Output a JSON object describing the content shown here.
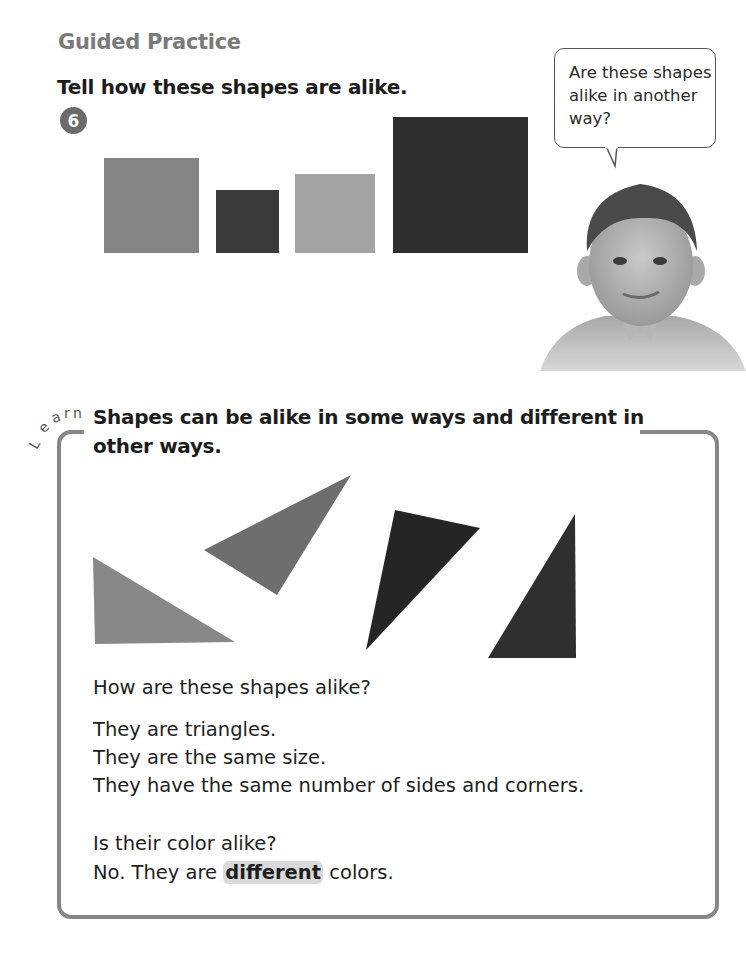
{
  "header": {
    "section_title": "Guided Practice",
    "instruction": "Tell how these shapes are alike."
  },
  "problem": {
    "number": "6",
    "squares": [
      {
        "x": 104,
        "y": 158,
        "w": 95,
        "h": 95,
        "color": "#848484"
      },
      {
        "x": 216,
        "y": 190,
        "w": 63,
        "h": 63,
        "color": "#3a3a3a"
      },
      {
        "x": 295,
        "y": 174,
        "w": 80,
        "h": 79,
        "color": "#a3a3a3"
      },
      {
        "x": 393,
        "y": 117,
        "w": 135,
        "h": 136,
        "color": "#2e2e2e"
      }
    ]
  },
  "speech_bubble": {
    "text": "Are these shapes alike in another way?"
  },
  "learn": {
    "label": "Learn",
    "title": "Shapes can be alike in some ways and different in other ways.",
    "triangles": [
      {
        "points": "93,557 95,644 235,642",
        "color": "#888888"
      },
      {
        "points": "204,550 351,475 277,595",
        "color": "#6e6e6e"
      },
      {
        "points": "395,510 480,528 366,650",
        "color": "#252525"
      },
      {
        "points": "575,514 576,658 488,658",
        "color": "#2f2f2f"
      }
    ],
    "question": "How are these shapes alike?",
    "answers": [
      "They are triangles.",
      "They are the same size.",
      "They have the same number of sides and corners."
    ],
    "color_question": "Is their color alike?",
    "color_answer_prefix": "No. They are ",
    "color_answer_highlight": "different",
    "color_answer_suffix": " colors."
  }
}
